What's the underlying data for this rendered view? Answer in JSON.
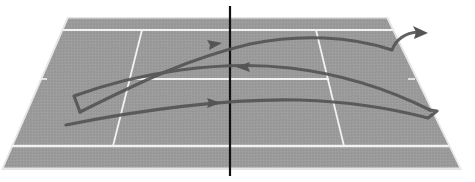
{
  "diagram": {
    "title": "Tennis court rally shot path",
    "description": "Perspective view of a tennis court with a single continuous ball path zig-zagging across the net three times, ending with an arrow leaving the court at the far right.",
    "colors": {
      "background": "#ffffff",
      "court_surface": "#9a9a9a",
      "court_lines": "#f4f4f4",
      "court_outer_edge": "#d8d8d8",
      "net": "#111111",
      "shot_path": "#555555"
    },
    "court": {
      "outer_top_left": [
        68,
        18
      ],
      "outer_top_right": [
        387,
        18
      ],
      "outer_bottom_right": [
        460,
        168
      ],
      "outer_bottom_left": [
        3,
        168
      ]
    },
    "net": {
      "x": 230,
      "y_top": 6,
      "y_bottom": 176
    },
    "shot_path": {
      "segments": [
        {
          "id": "shot-1",
          "direction": "left-to-right",
          "arrow_at": [
            214,
            103
          ]
        },
        {
          "id": "shot-2",
          "direction": "right-to-left",
          "arrow_at": [
            243,
            68
          ]
        },
        {
          "id": "shot-3",
          "direction": "left-to-right",
          "arrow_at": [
            214,
            45
          ]
        },
        {
          "id": "exit",
          "direction": "out-of-court",
          "arrow_at": [
            425,
            33
          ]
        }
      ]
    }
  }
}
